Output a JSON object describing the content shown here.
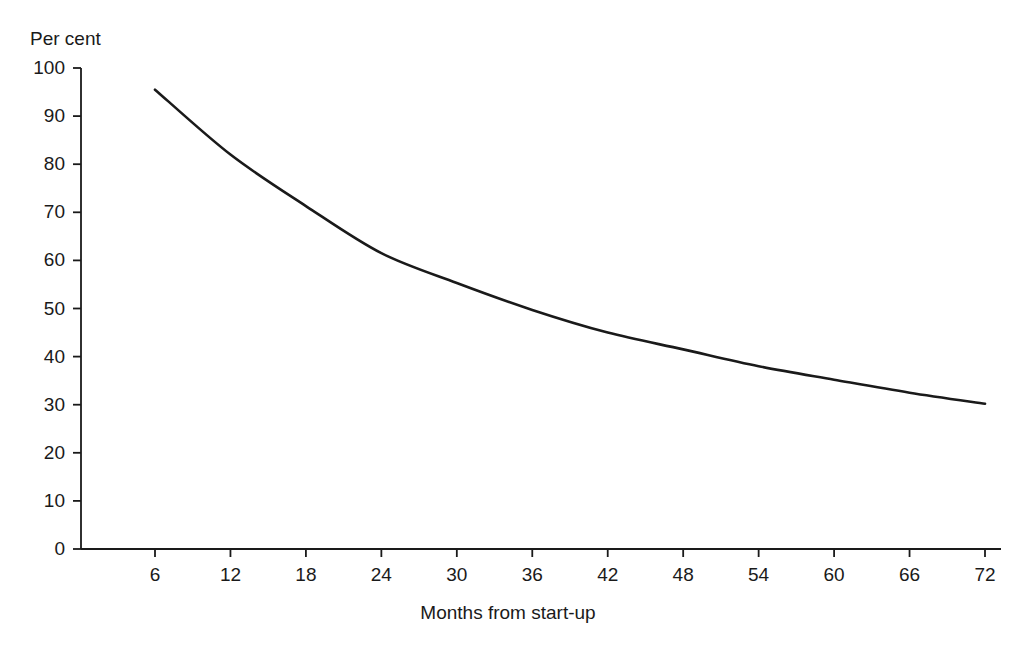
{
  "chart_data": {
    "type": "line",
    "title": "",
    "subtitle": "",
    "xlabel": "Months from start-up",
    "ylabel": "Per cent",
    "ylabel_position": "top-left",
    "grid": false,
    "legend": false,
    "legend_position": "none",
    "xlim": [
      0,
      78
    ],
    "ylim": [
      0,
      100
    ],
    "x_ticks": [
      6,
      12,
      18,
      24,
      30,
      36,
      42,
      48,
      54,
      60,
      66,
      72
    ],
    "x_tick_labels": [
      "6",
      "12",
      "18",
      "24",
      "30",
      "36",
      "42",
      "48",
      "54",
      "60",
      "66",
      "72"
    ],
    "y_ticks": [
      0,
      10,
      20,
      30,
      40,
      50,
      60,
      70,
      80,
      90,
      100
    ],
    "y_tick_labels": [
      "0",
      "10",
      "20",
      "30",
      "40",
      "50",
      "60",
      "70",
      "80",
      "90",
      "100"
    ],
    "x": [
      6,
      12,
      18,
      24,
      30,
      36,
      42,
      48,
      54,
      60,
      66,
      72
    ],
    "values": [
      95.5,
      82.0,
      71.3,
      61.5,
      55.3,
      49.7,
      45.0,
      41.5,
      38.0,
      35.2,
      32.5,
      30.2
    ],
    "series": [
      {
        "name": "Survival rate",
        "color": "#1a1a1a",
        "values": [
          95.5,
          82.0,
          71.3,
          61.5,
          55.3,
          49.7,
          45.0,
          41.5,
          38.0,
          35.2,
          32.5,
          30.2
        ]
      }
    ],
    "annotations": []
  },
  "axes": {
    "y_title": "Per cent",
    "x_title": "Months from start-up"
  },
  "style": {
    "line_color": "#1a1a1a",
    "axis_color": "#1a1a1a",
    "background": "#ffffff",
    "line_width": 2.6
  }
}
